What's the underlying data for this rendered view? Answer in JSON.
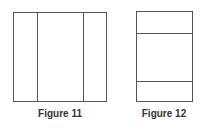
{
  "figures": [
    {
      "caption": "Figure 11",
      "description": "Square divided into three vertical columns (narrow-wide-narrow)",
      "stroke_color": "#555555"
    },
    {
      "caption": "Figure 12",
      "description": "Tall rectangle divided into three horizontal bands (short-tall-short)",
      "stroke_color": "#555555"
    }
  ]
}
